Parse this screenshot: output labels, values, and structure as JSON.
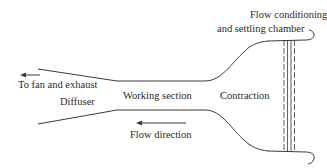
{
  "diagram": {
    "type": "wind-tunnel-schematic",
    "labels": {
      "flow_conditioning_line1": "Flow conditioning",
      "flow_conditioning_line2": "and settling chamber",
      "to_fan": "To fan and exhaust",
      "diffuser": "Diffuser",
      "working_section": "Working section",
      "contraction": "Contraction",
      "flow_direction": "Flow direction"
    },
    "colors": {
      "line": "#3a3a3a",
      "text": "#2a2a2a",
      "background": "#ffffff"
    },
    "sections": [
      "Diffuser",
      "Working section",
      "Contraction",
      "Flow conditioning and settling chamber"
    ]
  }
}
